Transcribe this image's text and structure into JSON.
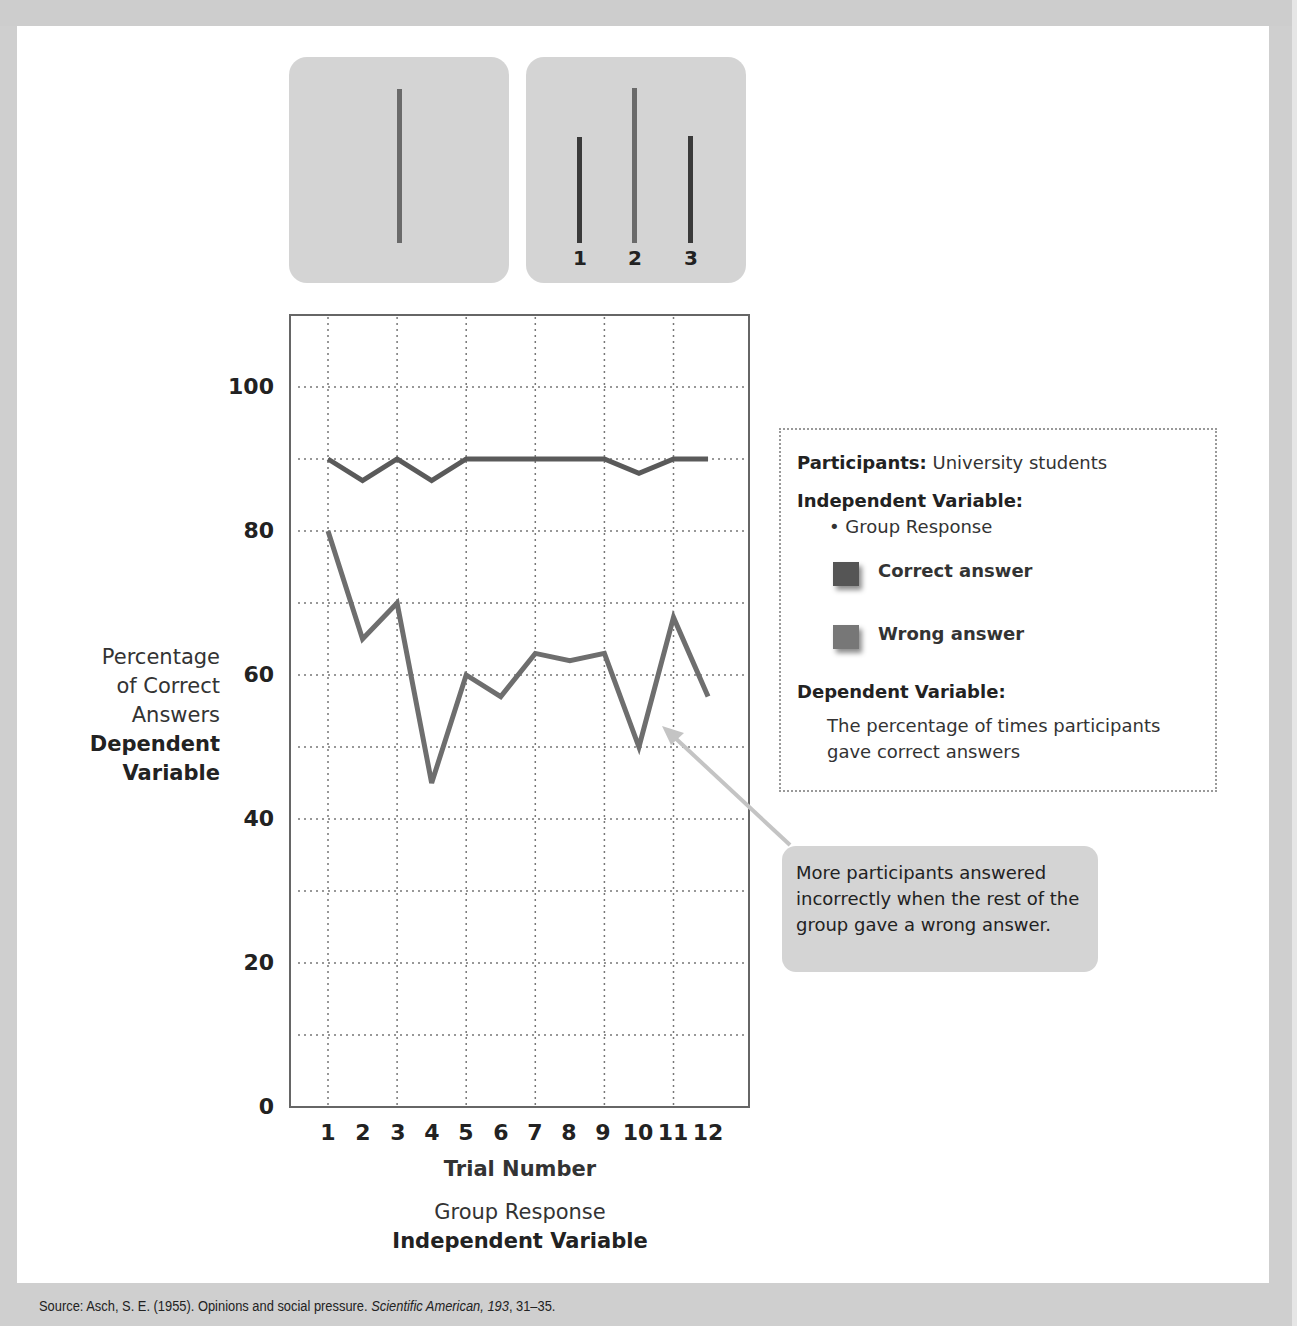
{
  "figure": {
    "source_prefix": "Source: Asch, S. E. (1955). Opinions and social pressure. ",
    "source_journal": "Scientific American, 193",
    "source_suffix": ", 31–35."
  },
  "stimulus": {
    "standard_card": {
      "line_color": "#6a6a6a"
    },
    "comparison_card": {
      "lines": [
        {
          "label": "1",
          "color": "#3a3a3a"
        },
        {
          "label": "2",
          "color": "#6a6a6a"
        },
        {
          "label": "3",
          "color": "#3a3a3a"
        }
      ]
    }
  },
  "axes": {
    "y_ticks": [
      "100",
      "80",
      "60",
      "40",
      "20",
      "0"
    ],
    "y_label_lines": [
      "Percentage",
      "of Correct",
      "Answers"
    ],
    "y_label_var_lines": [
      "Dependent",
      "Variable"
    ],
    "x_ticks": [
      "1",
      "2",
      "3",
      "4",
      "5",
      "6",
      "7",
      "8",
      "9",
      "10",
      "11",
      "12"
    ],
    "x_title": "Trial Number",
    "x_sub": "Group Response",
    "x_var": "Independent Variable"
  },
  "legend": {
    "participants_label": "Participants:",
    "participants_value": "University students",
    "iv_label": "Independent Variable:",
    "iv_item": "• Group Response",
    "correct_label": "Correct answer",
    "wrong_label": "Wrong answer",
    "dv_label": "Dependent Variable:",
    "dv_line1": "The percentage of times participants",
    "dv_line2": "gave correct answers",
    "colors": {
      "correct": "#555555",
      "wrong": "#777777"
    }
  },
  "callout": {
    "text": "More participants answered incorrectly when the rest of the group gave a wrong answer."
  },
  "chart_data": {
    "type": "line",
    "title": "",
    "xlabel": "Trial Number",
    "ylabel": "Percentage of Correct Answers",
    "x": [
      1,
      2,
      3,
      4,
      5,
      6,
      7,
      8,
      9,
      10,
      11,
      12
    ],
    "series": [
      {
        "name": "Correct answer",
        "color": "#5a5a5a",
        "values": [
          90,
          87,
          90,
          87,
          90,
          90,
          90,
          90,
          90,
          88,
          90,
          90
        ]
      },
      {
        "name": "Wrong answer",
        "color": "#6e6e6e",
        "values": [
          80,
          65,
          70,
          45,
          60,
          57,
          63,
          62,
          63,
          50,
          68,
          57
        ]
      }
    ],
    "ylim": [
      0,
      110
    ],
    "y_ticks": [
      0,
      20,
      40,
      60,
      80,
      100
    ],
    "grid": true,
    "legend_position": "right",
    "annotations": [
      "More participants answered incorrectly when the rest of the group gave a wrong answer."
    ]
  }
}
